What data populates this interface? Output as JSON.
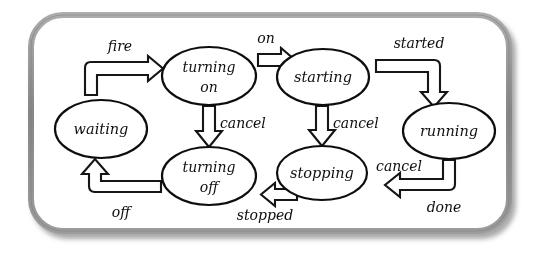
{
  "diagram": {
    "style": "hand-drawn",
    "frame": {
      "name": "rounded-frame",
      "border_color": "#8f8f8f",
      "shadow_color": "#b9b9b9",
      "fill_color": "#ffffff"
    },
    "states": [
      {
        "id": "waiting",
        "label": "waiting",
        "label_lines": [
          "waiting"
        ],
        "cx": 101,
        "cy": 129,
        "rx": 46,
        "ry": 29
      },
      {
        "id": "turning_on",
        "label": "turning on",
        "label_lines": [
          "turning",
          "on"
        ],
        "cx": 209,
        "cy": 76,
        "rx": 47,
        "ry": 29
      },
      {
        "id": "starting",
        "label": "starting",
        "label_lines": [
          "starting"
        ],
        "cx": 323,
        "cy": 77,
        "rx": 46,
        "ry": 28
      },
      {
        "id": "running",
        "label": "running",
        "label_lines": [
          "running"
        ],
        "cx": 449,
        "cy": 131,
        "rx": 46,
        "ry": 28
      },
      {
        "id": "turning_off",
        "label": "turning off",
        "label_lines": [
          "turning",
          "off"
        ],
        "cx": 209,
        "cy": 176,
        "rx": 47,
        "ry": 29
      },
      {
        "id": "stopping",
        "label": "stopping",
        "label_lines": [
          "stopping"
        ],
        "cx": 322,
        "cy": 173,
        "rx": 45,
        "ry": 27
      }
    ],
    "transitions": [
      {
        "id": "fire",
        "label": "fire",
        "from": "waiting",
        "to": "turning_on",
        "label_x": 120,
        "label_y": 47
      },
      {
        "id": "on",
        "label": "on",
        "from": "turning_on",
        "to": "starting",
        "label_x": 266,
        "label_y": 39
      },
      {
        "id": "started",
        "label": "started",
        "from": "starting",
        "to": "running",
        "label_x": 419,
        "label_y": 44
      },
      {
        "id": "cancel_1",
        "label": "cancel",
        "from": "turning_on",
        "to": "turning_off",
        "label_x": 235,
        "label_y": 124
      },
      {
        "id": "cancel_2",
        "label": "cancel",
        "from": "starting",
        "to": "stopping",
        "label_x": 349,
        "label_y": 124
      },
      {
        "id": "cancel_3",
        "label": "cancel",
        "from": "running",
        "to": "stopping",
        "label_x": 399,
        "label_y": 167
      },
      {
        "id": "done",
        "label": "done",
        "from": "running",
        "to": "stopping",
        "label_x": 444,
        "label_y": 208
      },
      {
        "id": "stopped",
        "label": "stopped",
        "from": "stopping",
        "to": "turning_off",
        "label_x": 265,
        "label_y": 216
      },
      {
        "id": "off",
        "label": "off",
        "from": "turning_off",
        "to": "waiting",
        "label_x": 121,
        "label_y": 213
      }
    ]
  }
}
